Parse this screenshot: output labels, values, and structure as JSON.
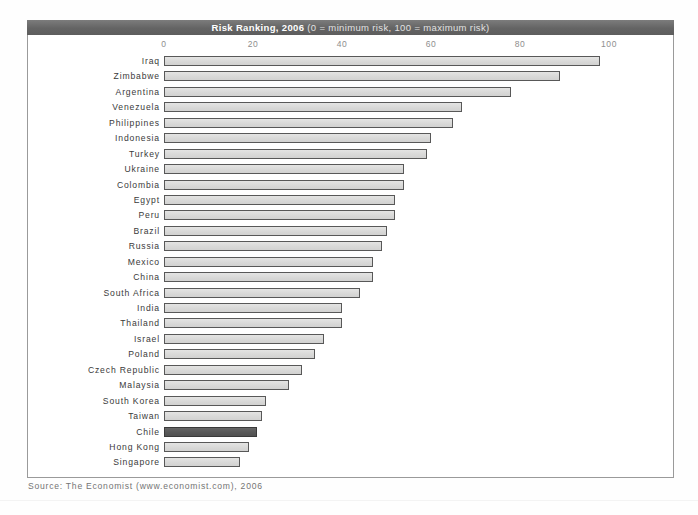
{
  "figure": {
    "title_main": "Risk Ranking, 2006",
    "title_sub": "(0 = minimum risk, 100 = maximum risk)",
    "source": "Source: The Economist (www.economist.com), 2006"
  },
  "colors": {
    "banner": "#646464",
    "bar_fill": "#dededd",
    "bar_border": "#585858",
    "highlight_fill": "#5c5c5c",
    "frame": "#9a9a9a",
    "tick_text": "#8e8e8e",
    "label_text": "#3a3a3a",
    "source_text": "#747474"
  },
  "chart_data": {
    "type": "bar",
    "orientation": "horizontal",
    "title": "Risk Ranking, 2006 (0 = minimum risk, 100 = maximum risk)",
    "xlabel": "",
    "ylabel": "",
    "xlim": [
      0,
      100
    ],
    "xticks": [
      0,
      20,
      40,
      60,
      80,
      100
    ],
    "xtick_labels": [
      "0",
      "20",
      "40",
      "60",
      "80",
      "100"
    ],
    "grid": false,
    "legend": false,
    "highlight_category": "Chile",
    "categories": [
      "Iraq",
      "Zimbabwe",
      "Argentina",
      "Venezuela",
      "Philippines",
      "Indonesia",
      "Turkey",
      "Ukraine",
      "Colombia",
      "Egypt",
      "Peru",
      "Brazil",
      "Russia",
      "Mexico",
      "China",
      "South Africa",
      "India",
      "Thailand",
      "Israel",
      "Poland",
      "Czech Republic",
      "Malaysia",
      "South Korea",
      "Taiwan",
      "Chile",
      "Hong Kong",
      "Singapore"
    ],
    "values": [
      98,
      89,
      78,
      67,
      65,
      60,
      59,
      54,
      54,
      52,
      52,
      50,
      49,
      47,
      47,
      44,
      40,
      40,
      36,
      34,
      31,
      28,
      23,
      22,
      21,
      19,
      17
    ]
  }
}
